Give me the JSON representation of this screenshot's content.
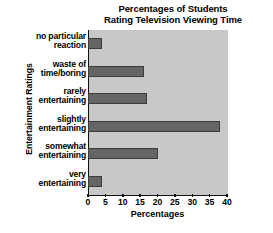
{
  "chart_data": {
    "type": "bar",
    "orientation": "horizontal",
    "title": "Percentages of Students Rating Television Viewing Time",
    "title_lines": [
      "Percentages of Students",
      "Rating Television Viewing Time"
    ],
    "xlabel": "Percentages",
    "ylabel": "Entertainment Ratings",
    "categories": [
      "no particular reaction",
      "waste of time/boring",
      "rarely entertaining",
      "slightly entertaining",
      "somewhat entertaining",
      "very entertaining"
    ],
    "category_lines": [
      [
        "no particular",
        "reaction"
      ],
      [
        "waste of",
        "time/boring"
      ],
      [
        "rarely",
        "entertaining"
      ],
      [
        "slightly",
        "entertaining"
      ],
      [
        "somewhat",
        "entertaining"
      ],
      [
        "very",
        "entertaining"
      ]
    ],
    "values": [
      4,
      16,
      17,
      38,
      20,
      4
    ],
    "xlim": [
      0,
      40
    ],
    "xticks": [
      0,
      5,
      10,
      15,
      20,
      25,
      30,
      35,
      40
    ],
    "xtick_labels": [
      "0",
      "5",
      "10",
      "15",
      "20",
      "25",
      "30",
      "35",
      "40"
    ],
    "grid": false,
    "legend": false,
    "bar_color": "#656565",
    "bar_edge_color": "#3b3b3b",
    "plot_background": "#c8c8c8",
    "figure_background": "#ffffff",
    "axis_color": "#111111"
  }
}
